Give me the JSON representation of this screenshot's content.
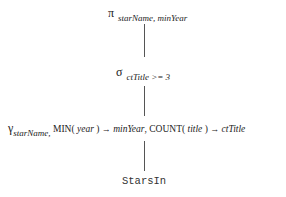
{
  "diagram": {
    "type": "relational-algebra-expression-tree",
    "nodes": {
      "projection": {
        "symbol": "π",
        "subscript": "starName, minYear"
      },
      "selection": {
        "symbol": "σ",
        "subscript": "ctTitle >= 3"
      },
      "grouping": {
        "symbol": "γ",
        "subscript": "starName,",
        "agg1_func": "MIN(",
        "agg1_arg": "year",
        "agg1_close": ")",
        "arrow": "→",
        "agg1_alias": "minYear",
        "separator": ",",
        "agg2_func": "COUNT(",
        "agg2_arg": "title",
        "agg2_close": ")",
        "agg2_alias": "ctTitle"
      },
      "relation": {
        "name": "StarsIn"
      }
    },
    "edges": [
      {
        "from": "projection",
        "to": "selection"
      },
      {
        "from": "selection",
        "to": "grouping"
      },
      {
        "from": "grouping",
        "to": "relation"
      }
    ]
  }
}
